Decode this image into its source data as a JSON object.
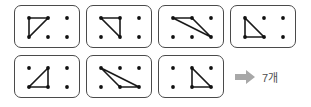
{
  "figure": {
    "grid": {
      "rows": 2,
      "cols": 3,
      "dot_positions": {
        "TL": [
          14,
          12
        ],
        "TM": [
          33,
          12
        ],
        "TR": [
          52,
          12
        ],
        "BL": [
          14,
          31
        ],
        "BM": [
          33,
          31
        ],
        "BR": [
          52,
          31
        ]
      },
      "dot_color": "#111111",
      "line_color": "#1a1a1a",
      "card_border_color": "#4a4a4a",
      "card_background": "#ffffff"
    },
    "cards": [
      {
        "id": 1,
        "name": "triangle-card-1",
        "vertices": [
          "TL",
          "TM",
          "BL"
        ]
      },
      {
        "id": 2,
        "name": "triangle-card-2",
        "vertices": [
          "TL",
          "TM",
          "BM"
        ]
      },
      {
        "id": 3,
        "name": "triangle-card-3",
        "vertices": [
          "TL",
          "TM",
          "BR"
        ]
      },
      {
        "id": 4,
        "name": "triangle-card-4",
        "vertices": [
          "TL",
          "BL",
          "BM"
        ]
      },
      {
        "id": 5,
        "name": "triangle-card-5",
        "vertices": [
          "TM",
          "BL",
          "BM"
        ]
      },
      {
        "id": 6,
        "name": "triangle-card-6",
        "vertices": [
          "TL",
          "BM",
          "BR"
        ]
      },
      {
        "id": 7,
        "name": "triangle-card-7",
        "vertices": [
          "TM",
          "BM",
          "BR"
        ]
      }
    ],
    "result": {
      "arrow_icon": "arrow-right-icon",
      "arrow_color": "#a8a8a8",
      "count": 7,
      "label": "7개"
    }
  }
}
